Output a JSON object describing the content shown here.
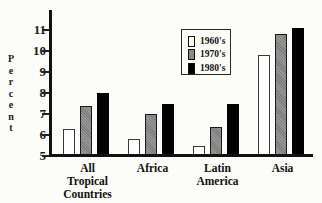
{
  "colors": {
    "background": "#fcfcf8",
    "axis": "#111111",
    "legend_border": "#2a2a2a"
  },
  "chart_data": {
    "type": "bar",
    "title": "",
    "xlabel": "",
    "ylabel": "Percent",
    "ylim": [
      5,
      12
    ],
    "yticks": [
      5,
      6,
      7,
      8,
      9,
      10,
      11
    ],
    "grid": false,
    "legend_position": "upper-center",
    "categories": [
      "All Tropical Countries",
      "Africa",
      "Latin America",
      "Asia"
    ],
    "series": [
      {
        "name": "1960's",
        "fill": "#ffffff",
        "border": "#3a3a3a",
        "pattern": "none",
        "values": [
          6.3,
          5.8,
          5.5,
          9.8
        ]
      },
      {
        "name": "1970's",
        "fill": "#8a8a8a",
        "border": "#1a1a1a",
        "pattern": "stipple",
        "values": [
          7.4,
          7.0,
          6.4,
          10.8
        ]
      },
      {
        "name": "1980's",
        "fill": "#000000",
        "border": "#000000",
        "pattern": "none",
        "values": [
          8.0,
          7.5,
          7.5,
          11.1
        ]
      }
    ]
  }
}
